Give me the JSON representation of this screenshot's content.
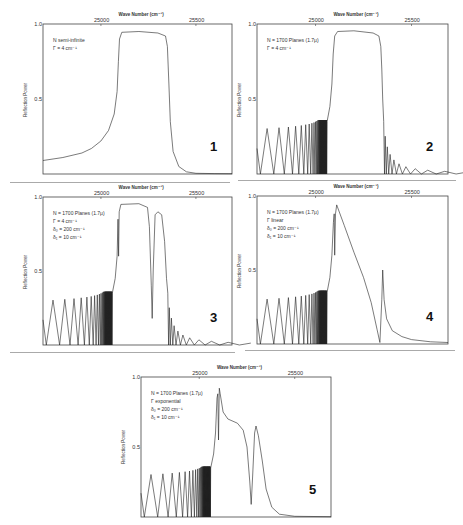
{
  "chart_data": [
    {
      "type": "line",
      "panel_number": "1",
      "title": "",
      "xlabel": "Wave Number (cm⁻¹)",
      "ylabel": "Reflection Power",
      "xticks": [
        "25000",
        "25500"
      ],
      "yticks": [
        "1.0",
        "0.5"
      ],
      "xlim": [
        24695,
        25690
      ],
      "ylim": [
        0,
        1.0
      ],
      "params": [
        "N   semi-infinite",
        "Γ = 4 cm⁻¹"
      ],
      "series": [
        {
          "name": "reflection",
          "points": [
            [
              24695,
              0.09
            ],
            [
              24800,
              0.11
            ],
            [
              24900,
              0.14
            ],
            [
              24950,
              0.17
            ],
            [
              25000,
              0.22
            ],
            [
              25040,
              0.29
            ],
            [
              25070,
              0.4
            ],
            [
              25085,
              0.55
            ],
            [
              25092,
              0.75
            ],
            [
              25098,
              0.9
            ],
            [
              25110,
              0.945
            ],
            [
              25200,
              0.95
            ],
            [
              25300,
              0.94
            ],
            [
              25340,
              0.92
            ],
            [
              25350,
              0.85
            ],
            [
              25358,
              0.6
            ],
            [
              25365,
              0.35
            ],
            [
              25380,
              0.15
            ],
            [
              25410,
              0.05
            ],
            [
              25450,
              0.015
            ],
            [
              25500,
              0.005
            ],
            [
              25600,
              0.003
            ],
            [
              25690,
              0.002
            ]
          ]
        }
      ]
    },
    {
      "type": "line",
      "panel_number": "2",
      "xlabel": "Wave Number (cm⁻¹)",
      "ylabel": "Reflection Power",
      "xticks": [
        "25000",
        "25500"
      ],
      "yticks": [
        "1.0",
        "0.5"
      ],
      "xlim": [
        24695,
        25690
      ],
      "ylim": [
        0,
        1.0
      ],
      "params": [
        "N = 1700 Planes (1.7μ)",
        "Γ = 4 cm⁻¹"
      ],
      "oscillation": {
        "start": 24695,
        "end": 25060,
        "first_period": 70,
        "period_decay": 0.78,
        "amplitude": 0.33
      },
      "series": [
        {
          "name": "reflection",
          "points": [
            [
              25060,
              0.35
            ],
            [
              25075,
              0.45
            ],
            [
              25085,
              0.6
            ],
            [
              25092,
              0.8
            ],
            [
              25100,
              0.92
            ],
            [
              25115,
              0.95
            ],
            [
              25200,
              0.955
            ],
            [
              25300,
              0.94
            ],
            [
              25330,
              0.92
            ],
            [
              25340,
              0.85
            ],
            [
              25345,
              0.7
            ],
            [
              25350,
              0.5
            ],
            [
              25355,
              0.35
            ]
          ]
        }
      ],
      "tail": {
        "start": 25355,
        "end": 25690,
        "first_period": 8,
        "period_growth": 1.35,
        "amplitude": 0.35
      }
    },
    {
      "type": "line",
      "panel_number": "3",
      "xlabel": "Wave Number (cm⁻¹)",
      "ylabel": "Reflection Power",
      "xticks": [
        "25000",
        "25500"
      ],
      "yticks": [
        "1.0",
        "0.5"
      ],
      "xlim": [
        24695,
        25690
      ],
      "ylim": [
        0,
        1.0
      ],
      "params": [
        "N = 1700 Planes (1.7μ)",
        "Γ = 4 cm⁻¹",
        "δ₀ = 200 cm⁻¹",
        "δ₁ = 10 cm⁻¹"
      ],
      "oscillation": {
        "start": 24695,
        "end": 25060,
        "first_period": 70,
        "period_decay": 0.78,
        "amplitude": 0.33
      },
      "series": [
        {
          "name": "reflection",
          "points": [
            [
              25060,
              0.35
            ],
            [
              25075,
              0.45
            ],
            [
              25085,
              0.6
            ],
            [
              25090,
              0.85
            ],
            [
              25093,
              0.6
            ],
            [
              25096,
              0.9
            ],
            [
              25105,
              0.95
            ],
            [
              25200,
              0.955
            ],
            [
              25245,
              0.93
            ],
            [
              25255,
              0.8
            ],
            [
              25265,
              0.4
            ],
            [
              25270,
              0.18
            ],
            [
              25275,
              0.5
            ],
            [
              25285,
              0.88
            ],
            [
              25300,
              0.9
            ],
            [
              25320,
              0.88
            ],
            [
              25335,
              0.7
            ],
            [
              25345,
              0.45
            ],
            [
              25352,
              0.35
            ]
          ]
        }
      ],
      "tail": {
        "start": 25352,
        "end": 25690,
        "first_period": 8,
        "period_growth": 1.35,
        "amplitude": 0.35
      }
    },
    {
      "type": "line",
      "panel_number": "4",
      "xlabel": "Wave Number (cm⁻¹)",
      "ylabel": "Reflection Power",
      "xticks": [
        "25000",
        "25500"
      ],
      "yticks": [
        "1.0",
        "0.5"
      ],
      "xlim": [
        24695,
        25690
      ],
      "ylim": [
        0,
        1.0
      ],
      "params": [
        "N = 1700 Planes (1.7μ)",
        "Γ   linear",
        "δ₀ = 200 cm⁻¹",
        "δ₁ =  10 cm⁻¹"
      ],
      "oscillation": {
        "start": 24695,
        "end": 25060,
        "first_period": 70,
        "period_decay": 0.78,
        "amplitude": 0.33
      },
      "series": [
        {
          "name": "reflection",
          "points": [
            [
              25060,
              0.35
            ],
            [
              25075,
              0.45
            ],
            [
              25085,
              0.6
            ],
            [
              25093,
              0.82
            ],
            [
              25097,
              0.88
            ],
            [
              25100,
              0.6
            ],
            [
              25104,
              0.88
            ],
            [
              25110,
              0.94
            ],
            [
              25150,
              0.8
            ],
            [
              25200,
              0.62
            ],
            [
              25250,
              0.45
            ],
            [
              25290,
              0.28
            ],
            [
              25320,
              0.1
            ],
            [
              25335,
              0.01
            ],
            [
              25345,
              0.3
            ],
            [
              25350,
              0.5
            ],
            [
              25357,
              0.3
            ],
            [
              25370,
              0.17
            ],
            [
              25400,
              0.09
            ],
            [
              25450,
              0.05
            ],
            [
              25500,
              0.03
            ],
            [
              25600,
              0.015
            ],
            [
              25690,
              0.01
            ]
          ]
        }
      ]
    },
    {
      "type": "line",
      "panel_number": "5",
      "xlabel": "Wave Number (cm⁻¹)",
      "ylabel": "Reflection Power",
      "xticks": [
        "25000",
        "25500"
      ],
      "yticks": [
        "1.0",
        "0.5"
      ],
      "xlim": [
        24695,
        25690
      ],
      "ylim": [
        0,
        1.0
      ],
      "params": [
        "N = 1700 Planes (1.7μ)",
        "Γ   exponential",
        "δ₀ = 200 cm⁻¹",
        "δ₁ =  10 cm⁻¹"
      ],
      "oscillation": {
        "start": 24695,
        "end": 25060,
        "first_period": 70,
        "period_decay": 0.78,
        "amplitude": 0.33
      },
      "series": [
        {
          "name": "reflection",
          "points": [
            [
              25060,
              0.35
            ],
            [
              25075,
              0.45
            ],
            [
              25085,
              0.6
            ],
            [
              25093,
              0.85
            ],
            [
              25097,
              0.88
            ],
            [
              25101,
              0.55
            ],
            [
              25105,
              0.92
            ],
            [
              25110,
              0.88
            ],
            [
              25125,
              0.75
            ],
            [
              25150,
              0.7
            ],
            [
              25200,
              0.67
            ],
            [
              25230,
              0.62
            ],
            [
              25250,
              0.5
            ],
            [
              25265,
              0.25
            ],
            [
              25272,
              0.09
            ],
            [
              25280,
              0.3
            ],
            [
              25290,
              0.6
            ],
            [
              25297,
              0.65
            ],
            [
              25310,
              0.58
            ],
            [
              25330,
              0.4
            ],
            [
              25350,
              0.2
            ],
            [
              25380,
              0.07
            ],
            [
              25420,
              0.02
            ],
            [
              25500,
              0.005
            ],
            [
              25690,
              0.002
            ]
          ]
        }
      ]
    }
  ],
  "panels": [
    {
      "number": "1",
      "xaxis_title": "Wave Number (cm⁻¹)",
      "tick_25000": "25000",
      "tick_25500": "25500",
      "ytick_top": "1.0",
      "ytick_mid": "0.5",
      "ylabel": "Reflection Power",
      "params": [
        "N   semi-infinite",
        "Γ = 4 cm⁻¹"
      ]
    },
    {
      "number": "2",
      "xaxis_title": "Wave Number (cm⁻¹)",
      "tick_25000": "25000",
      "tick_25500": "25500",
      "ytick_top": "1.0",
      "ytick_mid": "0.5",
      "ylabel": "Reflection Power",
      "params": [
        "N = 1700 Planes (1.7μ)",
        "Γ = 4 cm⁻¹"
      ]
    },
    {
      "number": "3",
      "xaxis_title": "Wave Number (cm⁻¹)",
      "tick_25000": "25000",
      "tick_25500": "25500",
      "ytick_top": "1.0",
      "ytick_mid": "0.5",
      "ylabel": "Reflection Power",
      "params": [
        "N = 1700 Planes (1.7μ)",
        "Γ = 4 cm⁻¹",
        "δ₀ = 200 cm⁻¹",
        "δ₁ =  10 cm⁻¹"
      ]
    },
    {
      "number": "4",
      "xaxis_title": "Wave Number (cm⁻¹)",
      "tick_25000": "25000",
      "tick_25500": "25500",
      "ytick_top": "1.0",
      "ytick_mid": "0.5",
      "ylabel": "Reflection Power",
      "params": [
        "N = 1700 Planes (1.7μ)",
        "Γ   linear",
        "δ₀ = 200 cm⁻¹",
        "δ₁ =  10 cm⁻¹"
      ]
    },
    {
      "number": "5",
      "xaxis_title": "Wave Number (cm⁻¹)",
      "tick_25000": "25000",
      "tick_25500": "25500",
      "ytick_top": "1.0",
      "ytick_mid": "0.5",
      "ylabel": "Reflection Power",
      "params": [
        "N = 1700 Planes (1.7μ)",
        "Γ   exponential",
        "δ₀ = 200 cm⁻¹",
        "δ₁ =  10 cm⁻¹"
      ]
    }
  ],
  "layout": {
    "boxes": [
      {
        "x": 43,
        "y": 24,
        "w": 189,
        "h": 150
      },
      {
        "x": 257,
        "y": 24,
        "w": 191,
        "h": 150
      },
      {
        "x": 43,
        "y": 197,
        "w": 189,
        "h": 148
      },
      {
        "x": 257,
        "y": 196,
        "w": 191,
        "h": 148
      },
      {
        "x": 141,
        "y": 377,
        "w": 190,
        "h": 140
      }
    ],
    "line_color": "#222222"
  }
}
